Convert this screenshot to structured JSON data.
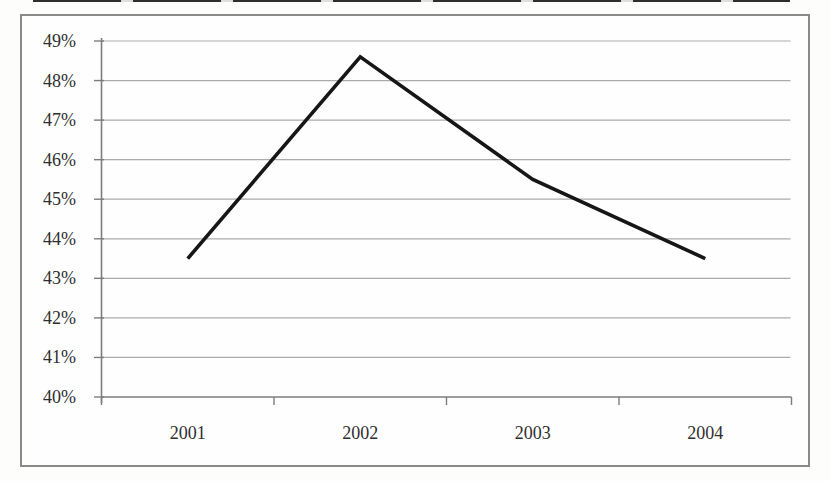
{
  "chart_data": {
    "type": "line",
    "title": "",
    "xlabel": "",
    "ylabel": "",
    "categories": [
      "2001",
      "2002",
      "2003",
      "2004"
    ],
    "series": [
      {
        "name": "percentage",
        "values": [
          43.5,
          48.6,
          45.5,
          43.5
        ]
      }
    ],
    "ylim": [
      40,
      49
    ],
    "ytick_step": 1,
    "ytick_labels": [
      "40%",
      "41%",
      "42%",
      "43%",
      "44%",
      "45%",
      "46%",
      "47%",
      "48%",
      "49%"
    ],
    "grid": true,
    "legend": false,
    "colors": {
      "line": "#161616",
      "grid": "#ababab",
      "axis": "#7d7d7d",
      "frame": "#8a8a8a",
      "text": "#2e2e2e",
      "background": "#fefefe"
    }
  }
}
